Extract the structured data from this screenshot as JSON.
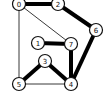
{
  "graph": {
    "nodes": [
      {
        "id": "0",
        "label": "0",
        "x": 19,
        "y": 4
      },
      {
        "id": "2",
        "label": "2",
        "x": 58,
        "y": 4
      },
      {
        "id": "6",
        "label": "6",
        "x": 96,
        "y": 30
      },
      {
        "id": "1",
        "label": "1",
        "x": 38,
        "y": 43
      },
      {
        "id": "7",
        "label": "7",
        "x": 71,
        "y": 44
      },
      {
        "id": "3",
        "label": "3",
        "x": 45,
        "y": 61
      },
      {
        "id": "5",
        "label": "5",
        "x": 19,
        "y": 84
      },
      {
        "id": "4",
        "label": "4",
        "x": 71,
        "y": 84
      }
    ],
    "edges": [
      {
        "from": "0",
        "to": "2",
        "weight": "thick"
      },
      {
        "from": "2",
        "to": "6",
        "weight": "thick"
      },
      {
        "from": "6",
        "to": "4",
        "weight": "thick"
      },
      {
        "from": "7",
        "to": "4",
        "weight": "thick"
      },
      {
        "from": "1",
        "to": "7",
        "weight": "thick"
      },
      {
        "from": "3",
        "to": "5",
        "weight": "thick"
      },
      {
        "from": "3",
        "to": "4",
        "weight": "thick"
      },
      {
        "from": "0",
        "to": "7",
        "weight": "thin"
      },
      {
        "from": "0",
        "to": "5",
        "weight": "thin"
      },
      {
        "from": "5",
        "to": "4",
        "weight": "thin"
      }
    ]
  }
}
